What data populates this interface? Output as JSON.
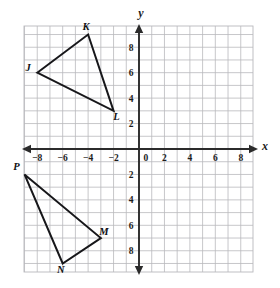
{
  "figure": {
    "axis_labels": {
      "x": "x",
      "y": "y"
    },
    "x_ticks": [
      "-8",
      "-6",
      "-4",
      "-2",
      "0",
      "2",
      "4",
      "6",
      "8"
    ],
    "y_ticks_positive": [
      "8",
      "6",
      "4",
      "2"
    ],
    "y_ticks_negative": [
      "2",
      "4",
      "6",
      "8"
    ],
    "colors": {
      "grid": "#b9b9bd",
      "axis": "#2b2b2b",
      "shape_stroke": "#17171a",
      "background": "#ffffff"
    }
  },
  "chart_data": {
    "type": "scatter",
    "title": "",
    "xlabel": "x",
    "ylabel": "y",
    "xlim": [
      -9,
      9
    ],
    "ylim": [
      -9.7,
      9.7
    ],
    "grid": true,
    "legend": "none",
    "x_tick_values": [
      -8,
      -6,
      -4,
      -2,
      0,
      2,
      4,
      6,
      8
    ],
    "y_tick_values": [
      -8,
      -6,
      -4,
      -2,
      2,
      4,
      6,
      8
    ],
    "origin_label": "0",
    "series": [
      {
        "name": "Triangle JKL",
        "closed": true,
        "points": [
          {
            "label": "J",
            "x": -8,
            "y": 6,
            "label_dx": -9,
            "label_dy": -2
          },
          {
            "label": "K",
            "x": -4,
            "y": 9,
            "label_dx": -2,
            "label_dy": -5
          },
          {
            "label": "L",
            "x": -2,
            "y": 3,
            "label_dx": 3,
            "label_dy": 9
          }
        ]
      },
      {
        "name": "Triangle PMN",
        "closed": true,
        "points": [
          {
            "label": "P",
            "x": -9,
            "y": -2,
            "label_dx": -8,
            "label_dy": -4
          },
          {
            "label": "M",
            "x": -3,
            "y": -7,
            "label_dx": 3,
            "label_dy": -3
          },
          {
            "label": "N",
            "x": -6,
            "y": -9,
            "label_dx": -2,
            "label_dy": 10
          }
        ]
      }
    ]
  }
}
